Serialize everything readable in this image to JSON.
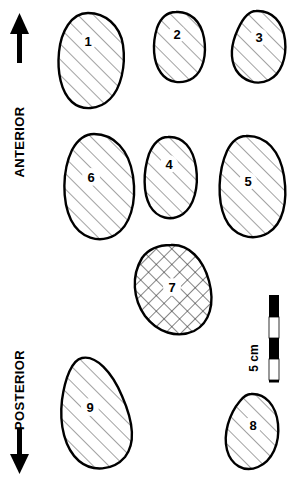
{
  "figure": {
    "width": 294,
    "height": 486,
    "background_color": "#ffffff",
    "outline_color": "#000000",
    "hatch_color": "#555555",
    "label_color": "#000000"
  },
  "orientation": {
    "anterior": {
      "label": "ANTERIOR",
      "arrow_direction": "up",
      "arrow_icon": "arrow-up-icon"
    },
    "posterior": {
      "label": "POSTERIOR",
      "arrow_direction": "down",
      "arrow_icon": "arrow-down-icon"
    }
  },
  "scale_bar": {
    "label": "5 cm",
    "orientation": "vertical",
    "segments": 4,
    "segment_colors": [
      "#000000",
      "#ffffff",
      "#000000",
      "#ffffff",
      "#000000"
    ],
    "top_y": 295,
    "bottom_y": 381,
    "x": 274
  },
  "shapes": [
    {
      "id": 1,
      "label": "1",
      "hatch": "diagonal",
      "label_x": 88,
      "label_y": 45,
      "path": "M 88 13 C 105 13 120 25 123 45 C 126 66 121 88 110 99 C 99 110 82 111 72 102 C 61 92 57 72 59 52 C 61 32 71 13 88 13 Z"
    },
    {
      "id": 2,
      "label": "2",
      "hatch": "diagonal",
      "label_x": 177,
      "label_y": 38,
      "path": "M 176 12 C 190 11 201 21 204 38 C 207 55 203 71 193 78 C 182 85 168 83 161 73 C 153 62 152 44 157 28 C 161 17 168 12 176 12 Z"
    },
    {
      "id": 3,
      "label": "3",
      "hatch": "diagonal",
      "label_x": 259,
      "label_y": 41,
      "path": "M 256 11 C 272 10 283 22 285 40 C 287 58 281 74 269 80 C 257 86 243 81 236 70 C 230 59 231 44 238 29 C 243 18 249 11 256 11 Z"
    },
    {
      "id": 4,
      "label": "4",
      "hatch": "diagonal",
      "label_x": 169,
      "label_y": 168,
      "path": "M 168 137 C 183 136 193 148 196 167 C 199 187 194 206 183 214 C 171 222 157 218 150 206 C 143 193 143 172 149 154 C 154 142 161 137 168 137 Z"
    },
    {
      "id": 5,
      "label": "5",
      "hatch": "diagonal",
      "label_x": 248,
      "label_y": 185,
      "path": "M 246 136 C 266 135 280 151 284 176 C 288 202 283 224 268 233 C 252 242 233 236 225 218 C 217 200 218 171 227 151 C 232 141 239 136 246 136 Z"
    },
    {
      "id": 6,
      "label": "6",
      "hatch": "diagonal",
      "label_x": 91,
      "label_y": 181,
      "path": "M 94 134 C 114 134 129 150 133 176 C 137 203 130 226 115 235 C 99 244 80 238 71 220 C 62 201 62 171 72 150 C 78 139 86 134 94 134 Z"
    },
    {
      "id": 7,
      "label": "7",
      "hatch": "crosshatch",
      "label_x": 172,
      "label_y": 291,
      "path": "M 171 245 C 189 244 203 259 209 281 C 215 303 210 323 194 331 C 177 339 157 332 145 316 C 133 299 131 276 142 258 C 149 248 160 245 171 245 Z"
    },
    {
      "id": 8,
      "label": "8",
      "hatch": "diagonal",
      "label_x": 253,
      "label_y": 429,
      "path": "M 251 394 C 265 393 276 405 278 424 C 280 444 272 461 258 467 C 244 473 231 465 227 450 C 223 434 229 414 240 401 C 244 396 248 394 251 394 Z"
    },
    {
      "id": 9,
      "label": "9",
      "hatch": "diagonal",
      "label_x": 90,
      "label_y": 411,
      "path": "M 82 358 C 96 355 112 372 122 396 C 133 421 136 443 125 457 C 113 471 92 472 79 461 C 65 449 59 425 62 400 C 65 378 72 360 82 358 Z"
    }
  ]
}
